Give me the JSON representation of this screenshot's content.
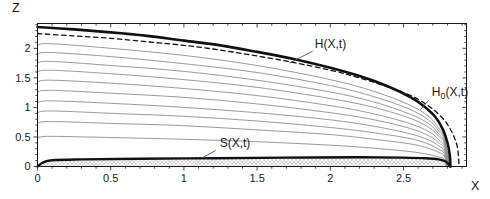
{
  "window": {
    "width": 490,
    "height": 199,
    "background": "#ffffff"
  },
  "chart_data": {
    "type": "line",
    "title": "",
    "xlabel": "X",
    "ylabel": "Z",
    "xlim": [
      0,
      2.93
    ],
    "ylim": [
      0,
      2.42
    ],
    "x_major_ticks": [
      0,
      0.5,
      1,
      1.5,
      2,
      2.5
    ],
    "x_tick_labels": [
      "0",
      "0.5",
      "1",
      "1.5",
      "2",
      "2.5"
    ],
    "y_major_ticks": [
      0,
      0.5,
      1,
      1.5,
      2
    ],
    "y_tick_labels": [
      "0",
      "0.5",
      "1",
      "1.5",
      "2"
    ],
    "minor_tick_step": 0.1,
    "grid": false,
    "frame": true,
    "legend": "none",
    "frame_color": "#1a1a1a",
    "text_color": "#1a1a1a",
    "leader_color": "#555555",
    "series": [
      {
        "name": "snapshot-1",
        "style": "thin-solid",
        "color": "#8e8e8e",
        "width": 0.9,
        "points": [
          [
            0,
            2.01
          ],
          [
            0.06,
            2.08
          ],
          [
            0.5,
            2.0
          ],
          [
            1,
            1.88
          ],
          [
            1.5,
            1.71
          ],
          [
            2,
            1.47
          ],
          [
            2.3,
            1.27
          ],
          [
            2.55,
            1.03
          ],
          [
            2.68,
            0.83
          ],
          [
            2.74,
            0.65
          ],
          [
            2.78,
            0.48
          ],
          [
            2.817,
            0
          ]
        ]
      },
      {
        "name": "snapshot-2",
        "style": "thin-solid",
        "color": "#8e8e8e",
        "width": 0.9,
        "points": [
          [
            0,
            1.86
          ],
          [
            0.06,
            1.93
          ],
          [
            0.5,
            1.86
          ],
          [
            1,
            1.74
          ],
          [
            1.5,
            1.59
          ],
          [
            2,
            1.37
          ],
          [
            2.3,
            1.18
          ],
          [
            2.55,
            0.96
          ],
          [
            2.68,
            0.77
          ],
          [
            2.74,
            0.6
          ],
          [
            2.78,
            0.45
          ],
          [
            2.814,
            0
          ]
        ]
      },
      {
        "name": "snapshot-3",
        "style": "thin-solid",
        "color": "#8e8e8e",
        "width": 0.9,
        "points": [
          [
            0,
            1.71
          ],
          [
            0.06,
            1.78
          ],
          [
            0.5,
            1.71
          ],
          [
            1,
            1.61
          ],
          [
            1.5,
            1.46
          ],
          [
            2,
            1.26
          ],
          [
            2.3,
            1.09
          ],
          [
            2.55,
            0.88
          ],
          [
            2.68,
            0.71
          ],
          [
            2.74,
            0.55
          ],
          [
            2.78,
            0.41
          ],
          [
            2.811,
            0
          ]
        ]
      },
      {
        "name": "snapshot-4",
        "style": "thin-solid",
        "color": "#8e8e8e",
        "width": 0.9,
        "points": [
          [
            0,
            1.56
          ],
          [
            0.06,
            1.63
          ],
          [
            0.5,
            1.57
          ],
          [
            1,
            1.47
          ],
          [
            1.5,
            1.34
          ],
          [
            2,
            1.15
          ],
          [
            2.3,
            1.0
          ],
          [
            2.55,
            0.81
          ],
          [
            2.68,
            0.65
          ],
          [
            2.74,
            0.51
          ],
          [
            2.78,
            0.38
          ],
          [
            2.808,
            0
          ]
        ]
      },
      {
        "name": "snapshot-5",
        "style": "thin-solid",
        "color": "#8e8e8e",
        "width": 0.9,
        "points": [
          [
            0,
            1.39
          ],
          [
            0.06,
            1.46
          ],
          [
            0.5,
            1.41
          ],
          [
            1,
            1.32
          ],
          [
            1.5,
            1.2
          ],
          [
            2,
            1.03
          ],
          [
            2.3,
            0.89
          ],
          [
            2.55,
            0.72
          ],
          [
            2.68,
            0.58
          ],
          [
            2.74,
            0.45
          ],
          [
            2.78,
            0.34
          ],
          [
            2.805,
            0
          ]
        ]
      },
      {
        "name": "snapshot-6",
        "style": "thin-solid",
        "color": "#8e8e8e",
        "width": 0.9,
        "points": [
          [
            0,
            1.22
          ],
          [
            0.06,
            1.29
          ],
          [
            0.5,
            1.24
          ],
          [
            1,
            1.17
          ],
          [
            1.5,
            1.06
          ],
          [
            2,
            0.91
          ],
          [
            2.3,
            0.79
          ],
          [
            2.55,
            0.64
          ],
          [
            2.68,
            0.51
          ],
          [
            2.74,
            0.4
          ],
          [
            2.78,
            0.3
          ],
          [
            2.802,
            0
          ]
        ]
      },
      {
        "name": "snapshot-7",
        "style": "thin-solid",
        "color": "#8e8e8e",
        "width": 0.9,
        "points": [
          [
            0,
            1.04
          ],
          [
            0.06,
            1.11
          ],
          [
            0.5,
            1.07
          ],
          [
            1,
            1.0
          ],
          [
            1.5,
            0.91
          ],
          [
            2,
            0.79
          ],
          [
            2.3,
            0.68
          ],
          [
            2.55,
            0.55
          ],
          [
            2.68,
            0.44
          ],
          [
            2.74,
            0.35
          ],
          [
            2.78,
            0.26
          ],
          [
            2.799,
            0
          ]
        ]
      },
      {
        "name": "snapshot-8",
        "style": "thin-solid",
        "color": "#8e8e8e",
        "width": 0.9,
        "points": [
          [
            0,
            0.87
          ],
          [
            0.06,
            0.94
          ],
          [
            0.5,
            0.9
          ],
          [
            1,
            0.85
          ],
          [
            1.5,
            0.77
          ],
          [
            2,
            0.66
          ],
          [
            2.3,
            0.57
          ],
          [
            2.55,
            0.47
          ],
          [
            2.68,
            0.37
          ],
          [
            2.74,
            0.29
          ],
          [
            2.78,
            0.22
          ],
          [
            2.796,
            0
          ]
        ]
      },
      {
        "name": "snapshot-9",
        "style": "thin-solid",
        "color": "#8e8e8e",
        "width": 0.9,
        "points": [
          [
            0,
            0.7
          ],
          [
            0.06,
            0.76
          ],
          [
            0.5,
            0.73
          ],
          [
            1,
            0.69
          ],
          [
            1.5,
            0.62
          ],
          [
            2,
            0.54
          ],
          [
            2.3,
            0.46
          ],
          [
            2.55,
            0.38
          ],
          [
            2.68,
            0.3
          ],
          [
            2.74,
            0.24
          ],
          [
            2.78,
            0.18
          ],
          [
            2.793,
            0
          ]
        ]
      },
      {
        "name": "snapshot-10",
        "style": "thin-solid",
        "color": "#8e8e8e",
        "width": 0.9,
        "points": [
          [
            0,
            0.46
          ],
          [
            0.06,
            0.51
          ],
          [
            0.5,
            0.49
          ],
          [
            1,
            0.46
          ],
          [
            1.5,
            0.42
          ],
          [
            2,
            0.36
          ],
          [
            2.3,
            0.31
          ],
          [
            2.55,
            0.25
          ],
          [
            2.68,
            0.2
          ],
          [
            2.74,
            0.16
          ],
          [
            2.78,
            0.12
          ],
          [
            2.79,
            0
          ]
        ]
      },
      {
        "name": "H0(X,t)",
        "style": "dashed",
        "color": "#111111",
        "width": 1.3,
        "dash": [
          4.5,
          3.5
        ],
        "points": [
          [
            0,
            2.25
          ],
          [
            0.25,
            2.21
          ],
          [
            0.5,
            2.17
          ],
          [
            0.75,
            2.11
          ],
          [
            1,
            2.05
          ],
          [
            1.25,
            1.97
          ],
          [
            1.5,
            1.87
          ],
          [
            1.75,
            1.76
          ],
          [
            2,
            1.63
          ],
          [
            2.2,
            1.5
          ],
          [
            2.4,
            1.34
          ],
          [
            2.55,
            1.2
          ],
          [
            2.65,
            1.06
          ],
          [
            2.72,
            0.93
          ],
          [
            2.78,
            0.78
          ],
          [
            2.82,
            0.63
          ],
          [
            2.85,
            0.47
          ],
          [
            2.87,
            0.3
          ],
          [
            2.88,
            0
          ]
        ]
      },
      {
        "name": "H(X,t)",
        "style": "thick-solid",
        "color": "#111111",
        "width": 2.6,
        "points": [
          [
            0,
            2.36
          ],
          [
            0.25,
            2.32
          ],
          [
            0.5,
            2.27
          ],
          [
            0.75,
            2.21
          ],
          [
            1,
            2.13
          ],
          [
            1.25,
            2.05
          ],
          [
            1.5,
            1.94
          ],
          [
            1.75,
            1.82
          ],
          [
            2,
            1.67
          ],
          [
            2.2,
            1.53
          ],
          [
            2.4,
            1.35
          ],
          [
            2.55,
            1.17
          ],
          [
            2.65,
            1.0
          ],
          [
            2.72,
            0.83
          ],
          [
            2.77,
            0.62
          ],
          [
            2.8,
            0.4
          ],
          [
            2.815,
            0.2
          ],
          [
            2.82,
            0
          ]
        ]
      },
      {
        "name": "S(X,t)",
        "style": "thick-solid",
        "color": "#111111",
        "width": 2.4,
        "fill": "hatch",
        "points": [
          [
            0,
            0
          ],
          [
            0.04,
            0.07
          ],
          [
            0.1,
            0.105
          ],
          [
            0.3,
            0.12
          ],
          [
            0.7,
            0.13
          ],
          [
            1.2,
            0.14
          ],
          [
            1.7,
            0.15
          ],
          [
            2.2,
            0.155
          ],
          [
            2.5,
            0.15
          ],
          [
            2.65,
            0.14
          ],
          [
            2.74,
            0.12
          ],
          [
            2.79,
            0.08
          ],
          [
            2.82,
            0
          ]
        ]
      }
    ],
    "annotations": [
      {
        "id": "H",
        "parts": [
          {
            "t": "H(X,t)"
          }
        ],
        "x": 1.894,
        "z": 2.0,
        "leader": [
          [
            1.879,
            1.95
          ],
          [
            1.72,
            1.75
          ]
        ]
      },
      {
        "id": "H0",
        "parts": [
          {
            "t": "H"
          },
          {
            "t": "0",
            "sub": true
          },
          {
            "t": "(X,t)"
          }
        ],
        "x": 2.693,
        "z": 1.186,
        "leader": [
          [
            2.672,
            1.12
          ],
          [
            2.615,
            0.96
          ]
        ]
      },
      {
        "id": "S",
        "parts": [
          {
            "t": "S(X,t)"
          }
        ],
        "x": 1.244,
        "z": 0.322,
        "leader": [
          [
            1.217,
            0.27
          ],
          [
            1.124,
            0.145
          ]
        ]
      }
    ],
    "hatch": {
      "color": "#a8a8a8",
      "size": 4
    }
  }
}
